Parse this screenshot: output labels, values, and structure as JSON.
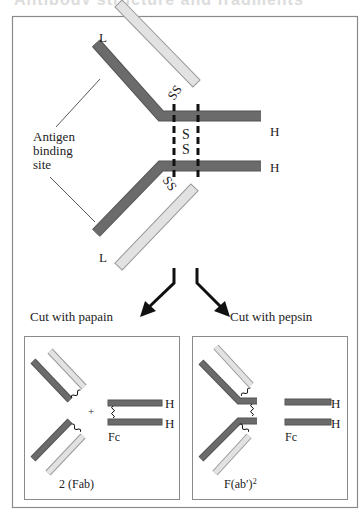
{
  "header": {
    "title": "Antibody structure and fragments"
  },
  "colors": {
    "heavy_chain": "#6b6b6b",
    "light_chain": "#e2e2e2",
    "frame": "#8a8a8a",
    "text": "#222222"
  },
  "diagram": {
    "intact_antibody": {
      "light_chain_label_top": "L",
      "light_chain_label_bottom": "L",
      "heavy_chain_label_top": "H",
      "heavy_chain_label_bottom": "H",
      "antigen_site_label": [
        "Antigen",
        "binding",
        "site"
      ],
      "disulfide_hinge": "S\nS",
      "disulfide_light_top": "SS",
      "disulfide_light_bottom": "SS"
    },
    "cut_papain": "Cut with papain",
    "cut_pepsin": "Cut with pepsin",
    "papain_panel": {
      "plus_sign": "+",
      "fragment_label": "2 (Fab)",
      "fc_label": "Fc",
      "h_top": "H",
      "h_bottom": "H"
    },
    "pepsin_panel": {
      "fragment_label": "F(ab′)",
      "fragment_superscript": "2",
      "fc_label": "Fc",
      "h_top": "H",
      "h_bottom": "H"
    }
  }
}
